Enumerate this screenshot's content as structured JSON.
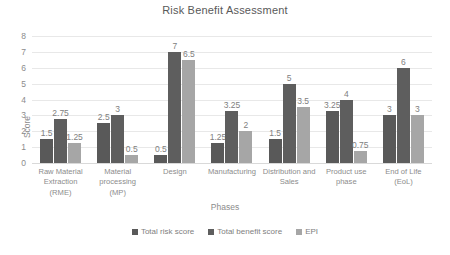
{
  "chart_data": {
    "type": "bar",
    "title": "Risk Benefit Assessment",
    "xlabel": "Phases",
    "ylabel": "Score",
    "ylim": [
      0,
      8
    ],
    "yticks": [
      8,
      7,
      6,
      5,
      4,
      3,
      2,
      1,
      0
    ],
    "grid": true,
    "legend_position": "bottom",
    "categories": [
      "Raw Material Extraction (RME)",
      "Material processing (MP)",
      "Design",
      "Manufacturing",
      "Distribution and Sales",
      "Product use phase",
      "End of Life (EoL)"
    ],
    "category_lines": [
      [
        "Raw Material",
        "Extraction",
        "(RME)"
      ],
      [
        "Material",
        "processing (MP)"
      ],
      [
        "Design"
      ],
      [
        "Manufacturing"
      ],
      [
        "Distribution and",
        "Sales"
      ],
      [
        "Product use",
        "phase"
      ],
      [
        "End of Life (EoL)"
      ]
    ],
    "series": [
      {
        "name": "Total risk score",
        "color": "#595959",
        "values": [
          1.5,
          2.5,
          0.5,
          1.25,
          1.5,
          3.25,
          3
        ],
        "labels": [
          "1.5",
          "2.5",
          "0.5",
          "1.25",
          "1.5",
          "3.25",
          "3"
        ]
      },
      {
        "name": "Total benefit score",
        "color": "#5e5e5e",
        "values": [
          2.75,
          3,
          7,
          3.25,
          5,
          4,
          6
        ],
        "labels": [
          "2.75",
          "3",
          "7",
          "3.25",
          "5",
          "4",
          "6"
        ]
      },
      {
        "name": "EPI",
        "color": "#a6a6a6",
        "values": [
          1.25,
          0.5,
          6.5,
          2,
          3.5,
          0.75,
          3
        ],
        "labels": [
          "1.25",
          "0.5",
          "6.5",
          "2",
          "3.5",
          "0.75",
          "3"
        ]
      }
    ]
  }
}
